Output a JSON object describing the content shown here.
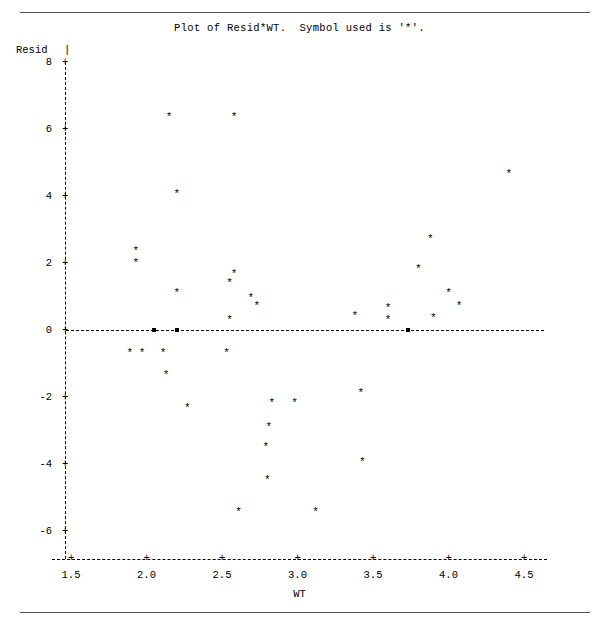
{
  "title": "Plot of Resid*WT.  Symbol used is '*'.",
  "symbol": "*",
  "axes": {
    "y_title": "Resid",
    "y_title_bar": "|",
    "x_title": "WT",
    "y_ticks": [
      "8",
      "6",
      "4",
      "2",
      "0",
      "-2",
      "-4",
      "-6"
    ],
    "x_ticks": [
      "1.5",
      "2.0",
      "2.5",
      "3.0",
      "3.5",
      "4.0",
      "4.5"
    ],
    "tick_plus": "+",
    "axis_bar": "|"
  },
  "chart_data": {
    "type": "scatter",
    "title": "Plot of Resid*WT.  Symbol used is '*'.",
    "xlabel": "WT",
    "ylabel": "Resid",
    "xlim": [
      1.35,
      4.6
    ],
    "ylim": [
      -6.6,
      8.4
    ],
    "xticks": [
      1.5,
      2.0,
      2.5,
      3.0,
      3.5,
      4.0,
      4.5
    ],
    "yticks": [
      8,
      6,
      4,
      2,
      0,
      -2,
      -4,
      -6
    ],
    "grid": false,
    "legend": null,
    "marker": "*",
    "reference_line_y": 0,
    "points": [
      {
        "x": 2.15,
        "y": 6.3
      },
      {
        "x": 2.58,
        "y": 6.3
      },
      {
        "x": 4.4,
        "y": 4.6
      },
      {
        "x": 2.2,
        "y": 4.0
      },
      {
        "x": 1.93,
        "y": 2.3
      },
      {
        "x": 1.93,
        "y": 1.95
      },
      {
        "x": 3.88,
        "y": 2.65
      },
      {
        "x": 3.8,
        "y": 1.75
      },
      {
        "x": 2.58,
        "y": 1.6
      },
      {
        "x": 2.55,
        "y": 1.35
      },
      {
        "x": 2.2,
        "y": 1.05
      },
      {
        "x": 4.0,
        "y": 1.05
      },
      {
        "x": 2.69,
        "y": 0.9
      },
      {
        "x": 2.73,
        "y": 0.65
      },
      {
        "x": 4.07,
        "y": 0.65
      },
      {
        "x": 3.6,
        "y": 0.6
      },
      {
        "x": 3.38,
        "y": 0.35
      },
      {
        "x": 3.6,
        "y": 0.25
      },
      {
        "x": 3.9,
        "y": 0.3
      },
      {
        "x": 2.55,
        "y": 0.25
      },
      {
        "x": 2.05,
        "y": 0.0
      },
      {
        "x": 2.2,
        "y": 0.0
      },
      {
        "x": 3.73,
        "y": 0.0
      },
      {
        "x": 1.89,
        "y": -0.75
      },
      {
        "x": 1.97,
        "y": -0.75
      },
      {
        "x": 2.11,
        "y": -0.75
      },
      {
        "x": 2.53,
        "y": -0.75
      },
      {
        "x": 2.13,
        "y": -1.4
      },
      {
        "x": 2.27,
        "y": -2.4
      },
      {
        "x": 2.83,
        "y": -2.25
      },
      {
        "x": 2.98,
        "y": -2.25
      },
      {
        "x": 3.42,
        "y": -1.95
      },
      {
        "x": 2.81,
        "y": -2.95
      },
      {
        "x": 2.79,
        "y": -3.55
      },
      {
        "x": 3.43,
        "y": -4.0
      },
      {
        "x": 2.8,
        "y": -4.55
      },
      {
        "x": 2.61,
        "y": -5.5
      },
      {
        "x": 3.12,
        "y": -5.5
      }
    ]
  },
  "geometry": {
    "x0_px": 71,
    "x_unit_px": 151,
    "y0_px": 330,
    "y_unit_px": 33.5
  }
}
